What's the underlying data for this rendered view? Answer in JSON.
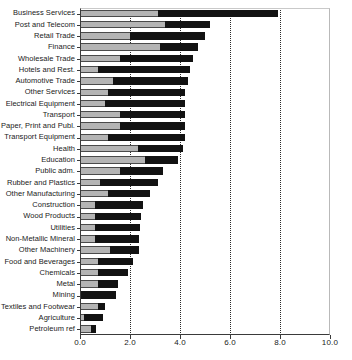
{
  "chart_data": {
    "type": "bar",
    "orientation": "horizontal",
    "stacked": true,
    "title": "",
    "subtitle": "",
    "xlabel": "",
    "ylabel": "",
    "xlim": [
      0.0,
      10.0
    ],
    "xticks": [
      0.0,
      2.0,
      4.0,
      6.0,
      8.0,
      10.0
    ],
    "xticklabels": [
      "0.0",
      "2.0",
      "4.0",
      "6.0",
      "8.0",
      "10.0"
    ],
    "gridlines": [
      2.0,
      4.0,
      6.0,
      8.0
    ],
    "grid": true,
    "legend": "none",
    "legend_position": "none",
    "annotations": [],
    "colors": {
      "segment_1": "#b4b4b4",
      "segment_2": "#121212",
      "axis": "#3a3a3a",
      "gridline": "#2b2b2b",
      "background": "#ffffff"
    },
    "categories": [
      "Business Services",
      "Post and Telecom",
      "Retail Trade",
      "Finance",
      "Wholesale Trade",
      "Hotels and Rest.",
      "Automotive Trade",
      "Other Services",
      "Electrical Equipment",
      "Transport",
      "Paper, Print and Publ.",
      "Transport Equipment",
      "Health",
      "Education",
      "Public adm.",
      "Rubber and Plastics",
      "Other Manufacturing",
      "Construction",
      "Wood Products",
      "Utilities",
      "Non-Metallic Mineral",
      "Other Machinery",
      "Food and Beverages",
      "Chemicals",
      "Metal",
      "Mining",
      "Textiles and Footwear",
      "Agriculture",
      "Petroleum ref"
    ],
    "series": [
      {
        "name": "segment-1",
        "color": "#b4b4b4",
        "values": [
          3.1,
          3.4,
          2.0,
          3.2,
          1.6,
          0.7,
          1.3,
          1.1,
          1.0,
          1.6,
          1.6,
          1.1,
          2.3,
          2.6,
          1.6,
          0.8,
          1.1,
          0.6,
          0.6,
          0.6,
          0.6,
          1.2,
          0.7,
          0.7,
          0.7,
          0.05,
          0.7,
          0.15,
          0.45
        ]
      },
      {
        "name": "segment-2",
        "color": "#121212",
        "values": [
          4.8,
          1.8,
          3.0,
          1.5,
          2.9,
          3.7,
          3.0,
          3.1,
          3.2,
          2.6,
          2.6,
          3.1,
          1.8,
          1.3,
          1.7,
          2.3,
          1.7,
          1.9,
          1.85,
          1.8,
          1.75,
          1.15,
          1.4,
          1.2,
          0.8,
          1.4,
          0.3,
          0.75,
          0.2
        ]
      }
    ],
    "totals": [
      7.9,
      5.2,
      5.0,
      4.7,
      4.5,
      4.4,
      4.3,
      4.2,
      4.2,
      4.2,
      4.2,
      4.2,
      4.1,
      3.9,
      3.3,
      3.1,
      2.8,
      2.5,
      2.45,
      2.4,
      2.35,
      2.35,
      2.1,
      1.9,
      1.5,
      1.45,
      1.0,
      0.9,
      0.65
    ]
  }
}
